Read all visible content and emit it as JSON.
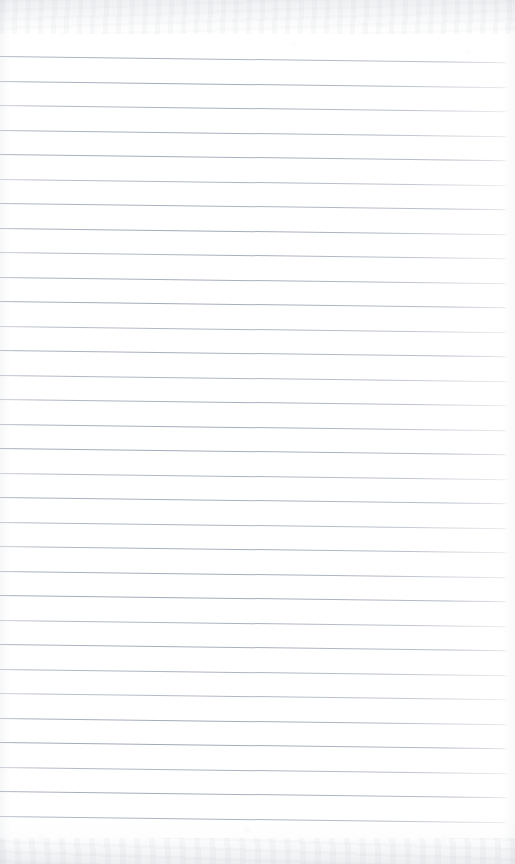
{
  "document": {
    "kind": "scanned-ruled-notebook-page",
    "title": "Blank Lined Page",
    "page_width": 515,
    "page_height": 864,
    "written_text": "",
    "handwriting_present": "none",
    "body_text": ""
  },
  "paper": {
    "background_color": "#ffffff",
    "tint_color": "#fafbfc",
    "edge_shadow_color": "#aeb4bc"
  },
  "ruling": {
    "line_color": "#969eae",
    "line_thickness_px": 1,
    "line_count": 32,
    "line_spacing_px": 24.5,
    "first_line_y_px": 56,
    "last_line_y_px": 836,
    "left_inset_px": 0,
    "right_inset_px": 7,
    "skew_degrees": 0.7,
    "margin_rule_present": "no",
    "margin_rule_color": ""
  },
  "scan_artifacts": {
    "top_band_height_px": 34,
    "bottom_band_height_px": 26,
    "band_color": "#b4b9c1",
    "description": "mottled gray scanner edge bands at top and bottom"
  }
}
